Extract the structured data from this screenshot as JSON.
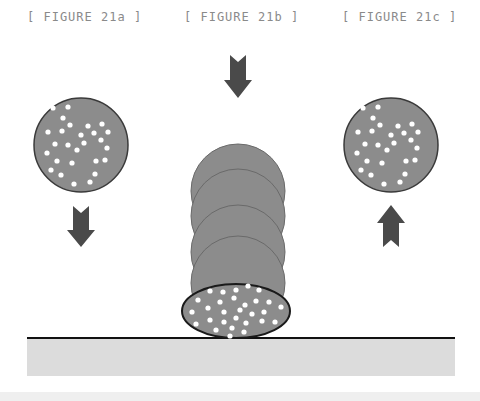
{
  "figures": [
    {
      "label": "[ FIGURE 21a ]",
      "arrow": "down"
    },
    {
      "label": "[ FIGURE 21b ]",
      "arrow": "down"
    },
    {
      "label": "[ FIGURE 21c ]",
      "arrow": "up"
    }
  ],
  "colors": {
    "ball_fill": "#8c8c8c",
    "ball_stroke": "#3a3a3a",
    "dot": "#ffffff",
    "arrow": "#4a4a4a",
    "ground_line": "#111111",
    "ground_fill": "#dcdcdc",
    "label": "#8a8a8a"
  }
}
